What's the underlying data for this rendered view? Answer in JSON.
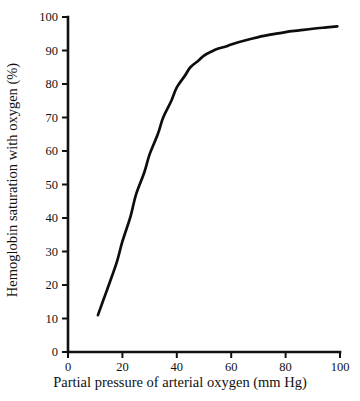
{
  "chart_data": {
    "type": "line",
    "title": "",
    "xlabel": "Partial pressure of arterial oxygen (mm Hg)",
    "ylabel": "Hemoglobin saturation with oxygen (%)",
    "xlim": [
      0,
      100
    ],
    "ylim": [
      0,
      100
    ],
    "xticks": [
      0,
      20,
      40,
      60,
      80,
      100
    ],
    "yticks": [
      0,
      10,
      20,
      30,
      40,
      50,
      60,
      70,
      80,
      90,
      100
    ],
    "xtick_labels": [
      "0",
      "20",
      "40",
      "60",
      "80",
      "100"
    ],
    "ytick_labels": [
      "0",
      "10",
      "20",
      "30",
      "40",
      "50",
      "60",
      "70",
      "80",
      "90",
      "100"
    ],
    "grid": false,
    "legend": null,
    "series": [
      {
        "name": "Oxygen-hemoglobin dissociation curve",
        "color": "#0d0d0d",
        "x": [
          11,
          13,
          15,
          18,
          20,
          23,
          25,
          28,
          30,
          33,
          35,
          38,
          40,
          43,
          45,
          48,
          50,
          53,
          55,
          58,
          60,
          65,
          70,
          75,
          80,
          85,
          90,
          95,
          99
        ],
        "values": [
          11,
          15.5,
          20,
          27,
          33,
          40.5,
          47,
          53.5,
          59,
          65,
          70,
          75,
          79,
          82.5,
          85,
          87,
          88.5,
          89.8,
          90.5,
          91.2,
          91.8,
          93.0,
          94.0,
          94.8,
          95.5,
          96.0,
          96.5,
          96.9,
          97.2
        ]
      }
    ]
  },
  "axes": {
    "tick_color": "#111111",
    "spine_color": "#111111"
  }
}
